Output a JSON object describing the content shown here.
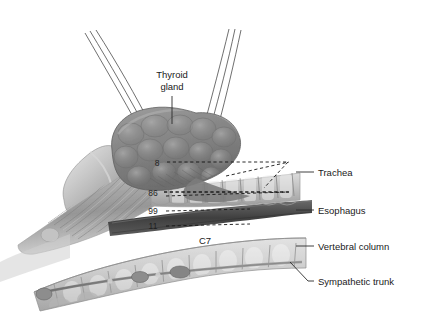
{
  "figure": {
    "title_label": "Thyroid gland",
    "background_color": "#ffffff",
    "ink_color": "#1a1a1a",
    "structure_tone": "#8a8a8a",
    "dark_tone": "#4a4a4a",
    "light_tone": "#d8d8d8"
  },
  "labels": {
    "thyroid_gland": "Thyroid gland",
    "thyroid_gland_line1": "Thyroid",
    "thyroid_gland_line2": "gland",
    "trachea": "Trachea",
    "esophagus": "Esophagus",
    "vertebral_column": "Vertebral column",
    "sympathetic_trunk": "Sympathetic trunk",
    "vertebra_c7": "C7"
  },
  "markers": [
    {
      "id": "marker-8",
      "value": "8",
      "x": 158,
      "y": 163
    },
    {
      "id": "marker-86",
      "value": "86",
      "x": 153,
      "y": 193
    },
    {
      "id": "marker-99",
      "value": "99",
      "x": 153,
      "y": 211
    },
    {
      "id": "marker-11",
      "value": "11",
      "x": 153,
      "y": 226
    }
  ],
  "structures": [
    {
      "name": "thyroid-gland",
      "tone": "#8a8a8a"
    },
    {
      "name": "trachea",
      "tone": "#b4b4b4"
    },
    {
      "name": "esophagus",
      "tone": "#4a4a4a"
    },
    {
      "name": "vertebral-column",
      "tone": "#c2c2c2"
    },
    {
      "name": "sympathetic-trunk",
      "tone": "#8d8d8d"
    },
    {
      "name": "larynx-muscle",
      "tone": "#9a9a9a"
    }
  ]
}
